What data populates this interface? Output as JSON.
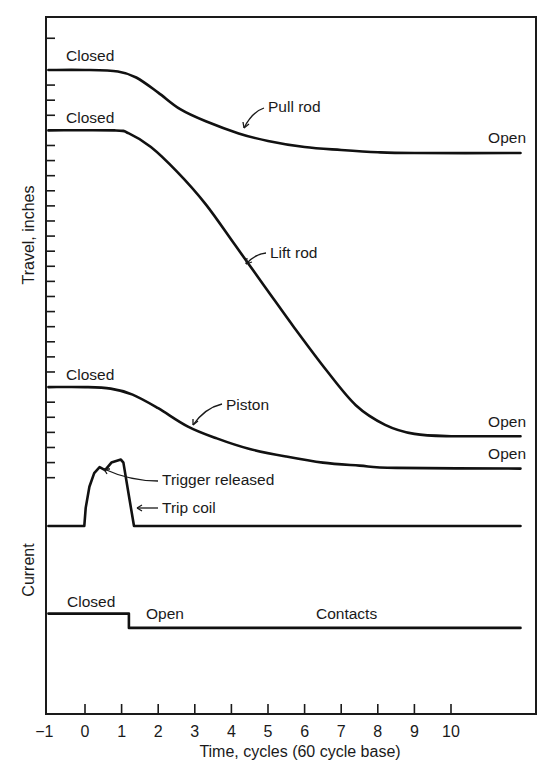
{
  "chart_data": {
    "type": "line",
    "title": "",
    "xlabel": "Time, cycles (60 cycle base)",
    "ylabel_upper": "Travel, inches",
    "ylabel_lower": "Current",
    "xlim": [
      -1,
      11.5
    ],
    "ylim": [
      -12.7,
      33
    ],
    "x_ticks": [
      -1,
      0,
      1,
      2,
      3,
      4,
      5,
      6,
      7,
      8,
      9,
      10
    ],
    "x_tick_labels": [
      "−1",
      "0",
      "1",
      "2",
      "3",
      "4",
      "5",
      "6",
      "7",
      "8",
      "9",
      "10"
    ],
    "y_minor_tick_levels": [
      32.3,
      29.2,
      28.2,
      27.2,
      25.2,
      24.2,
      23.2,
      22.2,
      21.2,
      20.2,
      19.2,
      18.2,
      17.2,
      16.2,
      15.2,
      14.2,
      13.2,
      12.2,
      11.2,
      10.2,
      8.2,
      7.2,
      6.2,
      5.2,
      4.2,
      3.2
    ],
    "grid": false,
    "series": [
      {
        "name": "Pull rod",
        "points": [
          [
            -1,
            30.2
          ],
          [
            0,
            30.2
          ],
          [
            0.9,
            30.1
          ],
          [
            1.4,
            29.7
          ],
          [
            2.0,
            28.7
          ],
          [
            2.6,
            27.6
          ],
          [
            3.3,
            26.8
          ],
          [
            4.2,
            26.0
          ],
          [
            5.0,
            25.5
          ],
          [
            6.0,
            25.1
          ],
          [
            7.0,
            24.9
          ],
          [
            8.0,
            24.75
          ],
          [
            9.0,
            24.7
          ],
          [
            11.9,
            24.7
          ]
        ],
        "start_label": "Closed",
        "end_label": "Open",
        "callout": "Pull rod"
      },
      {
        "name": "Lift rod",
        "points": [
          [
            -1,
            26.2
          ],
          [
            0.8,
            26.2
          ],
          [
            1.2,
            26.0
          ],
          [
            1.8,
            25.1
          ],
          [
            2.5,
            23.5
          ],
          [
            3.3,
            21.3
          ],
          [
            4.1,
            18.6
          ],
          [
            4.9,
            15.9
          ],
          [
            5.7,
            13.2
          ],
          [
            6.6,
            10.3
          ],
          [
            7.4,
            8.0
          ],
          [
            8.2,
            6.7
          ],
          [
            9.0,
            6.1
          ],
          [
            10.0,
            5.95
          ],
          [
            11.9,
            5.95
          ]
        ],
        "end_label": "Open",
        "start_label": "Closed",
        "callout": "Lift rod"
      },
      {
        "name": "Piston",
        "points": [
          [
            -1,
            9.2
          ],
          [
            0,
            9.2
          ],
          [
            0.7,
            9.1
          ],
          [
            1.3,
            8.7
          ],
          [
            2.0,
            7.8
          ],
          [
            2.8,
            6.6
          ],
          [
            3.6,
            5.8
          ],
          [
            4.5,
            5.1
          ],
          [
            5.5,
            4.6
          ],
          [
            6.5,
            4.2
          ],
          [
            7.5,
            4.0
          ],
          [
            8.5,
            3.85
          ],
          [
            11.9,
            3.8
          ]
        ],
        "start_label": "Closed",
        "end_label": "Open",
        "callout": "Piston"
      },
      {
        "name": "Trip coil",
        "points": [
          [
            -1,
            0
          ],
          [
            -0.02,
            0
          ],
          [
            0.02,
            1.2
          ],
          [
            0.12,
            2.6
          ],
          [
            0.25,
            3.5
          ],
          [
            0.4,
            3.9
          ],
          [
            0.55,
            3.7
          ],
          [
            0.72,
            4.2
          ],
          [
            0.98,
            4.4
          ],
          [
            1.05,
            4.2
          ],
          [
            1.2,
            2.0
          ],
          [
            1.34,
            0
          ],
          [
            11.9,
            0
          ]
        ],
        "callouts": [
          "Trigger released",
          "Trip coil"
        ]
      },
      {
        "name": "Contacts",
        "points": [
          [
            -1,
            -5.8
          ],
          [
            1.2,
            -5.8
          ],
          [
            1.2,
            -6.75
          ],
          [
            11.9,
            -6.75
          ]
        ],
        "start_label": "Closed",
        "mid_label": "Open",
        "callout": "Contacts"
      }
    ],
    "annotations": [
      "Closed",
      "Closed",
      "Closed",
      "Open",
      "Open",
      "Open",
      "Closed",
      "Open",
      "Pull rod",
      "Lift rod",
      "Piston",
      "Trigger released",
      "Trip coil",
      "Contacts"
    ]
  },
  "labels": {
    "pull_closed": "Closed",
    "lift_closed": "Closed",
    "piston_closed": "Closed",
    "pull_open": "Open",
    "lift_open": "Open",
    "piston_open": "Open",
    "pull_rod": "Pull rod",
    "lift_rod": "Lift rod",
    "piston": "Piston",
    "trigger_released": "Trigger released",
    "trip_coil": "Trip coil",
    "contacts_closed": "Closed",
    "contacts_open": "Open",
    "contacts": "Contacts"
  }
}
